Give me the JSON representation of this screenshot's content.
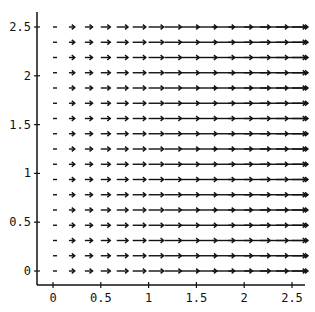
{
  "chart_data": {
    "type": "quiver",
    "title": "",
    "xlabel": "",
    "ylabel": "",
    "xlim": [
      -0.17,
      2.6
    ],
    "ylim": [
      -0.15,
      2.6
    ],
    "grid": false,
    "x_ticks": [
      0,
      0.5,
      1,
      1.5,
      2,
      2.5
    ],
    "x_tick_labels": [
      "0",
      "0.5",
      "1",
      "1.5",
      "2",
      "2.5"
    ],
    "y_ticks": [
      0,
      0.5,
      1,
      1.5,
      2,
      2.5
    ],
    "y_tick_labels": [
      "0",
      "0.5",
      "1",
      "1.5",
      "2",
      "2.5"
    ],
    "grid_points": {
      "x_count": 16,
      "y_count": 17,
      "x_range": [
        0,
        2.5
      ],
      "y_range": [
        0,
        2.5
      ]
    },
    "vector_field": "horizontal arrows pointing right (+x); length grows with x, near-zero at x=0",
    "color": "#111111"
  }
}
